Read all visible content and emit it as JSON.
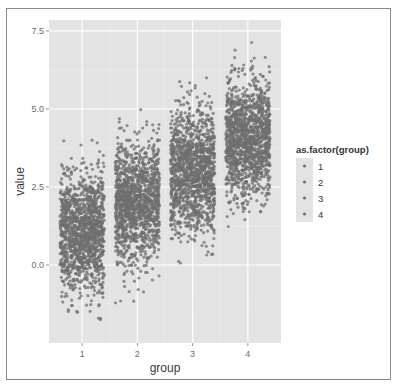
{
  "chart_data": {
    "type": "scatter",
    "subtype": "jitter",
    "title": "",
    "xlabel": "group",
    "ylabel": "value",
    "x_ticks": [
      "1",
      "2",
      "3",
      "4"
    ],
    "y_ticks": [
      0.0,
      2.5,
      5.0,
      7.5
    ],
    "y_tick_labels": [
      "0.0",
      "2.5",
      "5.0",
      "7.5"
    ],
    "ylim": [
      -2.5,
      7.85
    ],
    "xlim": [
      0.4,
      4.6
    ],
    "grid": true,
    "panel_background": "#e3e3e3",
    "point_color": "#6f6f6f",
    "legend": {
      "title": "as.factor(group)",
      "position": "right",
      "entries": [
        "1",
        "2",
        "3",
        "4"
      ]
    },
    "series": [
      {
        "name": "1",
        "x": 1,
        "mean": 1.0,
        "sd": 1.0,
        "min": -1.8,
        "max": 4.0,
        "n_approx": 2500
      },
      {
        "name": "2",
        "x": 2,
        "mean": 2.0,
        "sd": 1.0,
        "min": -1.3,
        "max": 5.6,
        "n_approx": 2500
      },
      {
        "name": "3",
        "x": 3,
        "mean": 3.0,
        "sd": 1.0,
        "min": -0.2,
        "max": 6.0,
        "n_approx": 2500
      },
      {
        "name": "4",
        "x": 4,
        "mean": 4.0,
        "sd": 1.0,
        "min": 0.7,
        "max": 7.3,
        "n_approx": 2500
      }
    ],
    "jitter_width": 0.4
  }
}
